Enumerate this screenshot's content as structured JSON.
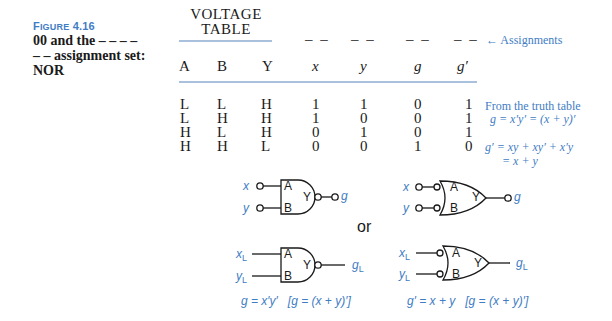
{
  "caption": {
    "figure_label_first": "F",
    "figure_label_rest": "IGURE",
    "figure_number": "4.16",
    "line1": "00 and the – – – –",
    "line2": "– – assignment set:",
    "line3": "NOR"
  },
  "voltage_table": {
    "title_line1": "VOLTAGE",
    "title_line2": "TABLE",
    "headers": [
      "A",
      "B",
      "Y"
    ]
  },
  "assignment_headers": {
    "dashes": [
      "– –",
      "– –",
      "– –",
      "– –"
    ],
    "arrow_label": "← Assignments",
    "columns": [
      "x",
      "y",
      "g",
      "g′"
    ]
  },
  "rows": [
    {
      "A": "L",
      "B": "L",
      "Y": "H",
      "x": "1",
      "y": "1",
      "g": "0",
      "gp": "1"
    },
    {
      "A": "L",
      "B": "H",
      "Y": "H",
      "x": "1",
      "y": "0",
      "g": "0",
      "gp": "1"
    },
    {
      "A": "H",
      "B": "L",
      "Y": "H",
      "x": "0",
      "y": "1",
      "g": "0",
      "gp": "1"
    },
    {
      "A": "H",
      "B": "H",
      "Y": "L",
      "x": "0",
      "y": "0",
      "g": "1",
      "gp": "0"
    }
  ],
  "notes": {
    "truth_table_label": "From the truth table",
    "g_equation": "g = x′y′ = (x + y)′",
    "gp_equation_line1": "g′ = xy + xy′ + x′y",
    "gp_equation_line2": "= x + y"
  },
  "diagrams": {
    "or_label": "or",
    "gate_pins": {
      "A": "A",
      "B": "B",
      "Y": "Y"
    },
    "top_left": {
      "in1": "x",
      "in2": "y",
      "out": "g"
    },
    "top_right": {
      "in1": "x",
      "in2": "y",
      "out": "g"
    },
    "bottom_left": {
      "in1": "x",
      "in1_sub": "L",
      "in2": "y",
      "in2_sub": "L",
      "out": "g",
      "out_sub": "L",
      "formula": "g = x′y′   [g = (x + y)′]"
    },
    "bottom_right": {
      "in1": "x",
      "in1_sub": "L",
      "in2": "y",
      "in2_sub": "L",
      "out": "g",
      "out_sub": "L",
      "formula": "g′ = x + y   [g = (x + y)′]"
    }
  },
  "colors": {
    "accent": "#3f7dc4",
    "rule": "#a9c1dd",
    "ink": "#1a1a1a"
  }
}
